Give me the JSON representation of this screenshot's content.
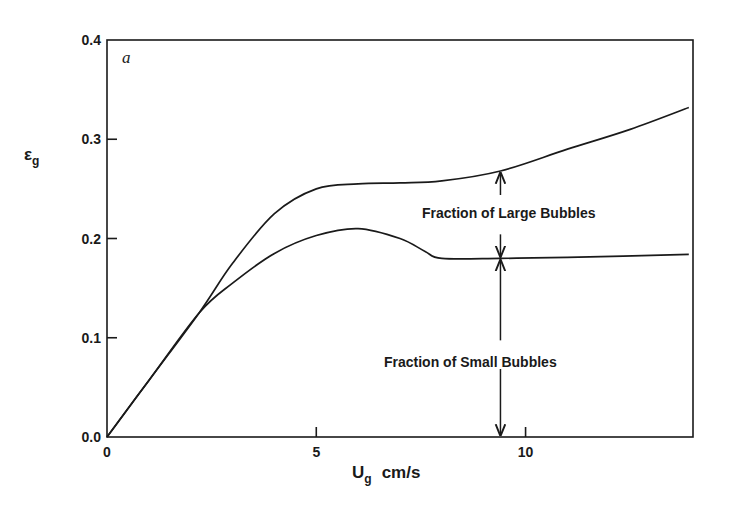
{
  "chart_data": {
    "type": "line",
    "title": "",
    "panel_label": "a",
    "xlabel": "U_g cm/s",
    "xlabel_main": "U",
    "xlabel_sub": "g",
    "xlabel_unit": "cm/s",
    "ylabel": "ε_g",
    "ylabel_main": "ε",
    "ylabel_sub": "g",
    "xlim": [
      0,
      14
    ],
    "ylim": [
      0.0,
      0.4
    ],
    "x_ticks": [
      0,
      5,
      10
    ],
    "x_tick_labels": [
      "0",
      "5",
      "10"
    ],
    "y_ticks": [
      0.0,
      0.1,
      0.2,
      0.3,
      0.4
    ],
    "y_tick_labels": [
      "0.0",
      "0.1",
      "0.2",
      "0.3",
      "0.4"
    ],
    "grid": false,
    "legend": "none",
    "series": [
      {
        "name": "Total gas holdup",
        "x": [
          0,
          1,
          2.2,
          3,
          4,
          5,
          6,
          7,
          8,
          9.4,
          11,
          12.5,
          13.9
        ],
        "y": [
          0,
          0.057,
          0.125,
          0.175,
          0.225,
          0.25,
          0.255,
          0.256,
          0.258,
          0.268,
          0.29,
          0.31,
          0.332
        ]
      },
      {
        "name": "Small bubble holdup",
        "x": [
          0,
          1,
          2.2,
          3,
          4,
          5,
          6,
          7,
          7.6,
          8,
          9.4,
          11,
          13.9
        ],
        "y": [
          0,
          0.057,
          0.125,
          0.155,
          0.185,
          0.203,
          0.21,
          0.2,
          0.187,
          0.18,
          0.18,
          0.181,
          0.184
        ]
      }
    ],
    "annotations": [
      {
        "text": "Fraction of Large Bubbles",
        "x": 9.4,
        "y_range": [
          0.18,
          0.268
        ],
        "arrow": "double"
      },
      {
        "text": "Fraction of Small Bubbles",
        "x": 9.4,
        "y_range": [
          0.0,
          0.18
        ],
        "arrow": "double"
      }
    ]
  }
}
